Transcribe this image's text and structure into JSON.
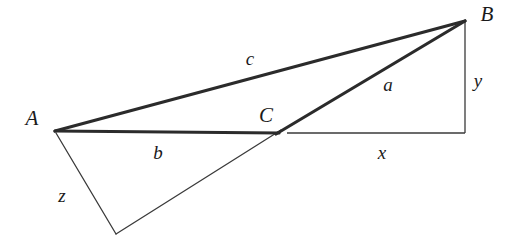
{
  "figure": {
    "type": "geometry-diagram",
    "background_color": "#ffffff",
    "stroke_color": "#2b2b2b",
    "thick_stroke_width": 3,
    "thin_stroke_width": 1,
    "width": 518,
    "height": 245
  },
  "vertices": [
    {
      "id": "A",
      "label": "A",
      "x": 55,
      "y": 131,
      "label_x": 32,
      "label_y": 118
    },
    {
      "id": "B",
      "label": "B",
      "x": 465,
      "y": 21,
      "label_x": 487,
      "label_y": 14
    },
    {
      "id": "C",
      "label": "C",
      "x": 278,
      "y": 133,
      "label_x": 266,
      "label_y": 115
    },
    {
      "id": "D",
      "label": "",
      "x": 116,
      "y": 234,
      "label_x": 116,
      "label_y": 234
    }
  ],
  "side_labels": [
    {
      "id": "c",
      "label": "c",
      "x": 250,
      "y": 58
    },
    {
      "id": "a",
      "label": "a",
      "x": 388,
      "y": 84
    },
    {
      "id": "b",
      "label": "b",
      "x": 158,
      "y": 152
    },
    {
      "id": "z",
      "label": "z",
      "x": 62,
      "y": 195
    },
    {
      "id": "x",
      "label": "x",
      "x": 382,
      "y": 152
    },
    {
      "id": "y",
      "label": "y",
      "x": 478,
      "y": 80
    }
  ],
  "segments": {
    "side_c": {
      "name": "segment-AB",
      "x1": 55,
      "y1": 131,
      "x2": 465,
      "y2": 21,
      "weight": "thick"
    },
    "side_b": {
      "name": "segment-AC",
      "x1": 55,
      "y1": 131,
      "x2": 279,
      "y2": 133,
      "weight": "thick"
    },
    "side_a": {
      "name": "segment-CB",
      "x1": 276,
      "y1": 134,
      "x2": 465,
      "y2": 21,
      "weight": "thick"
    },
    "leg_x": {
      "name": "segment-x",
      "x1": 287,
      "y1": 133,
      "x2": 465,
      "y2": 133,
      "weight": "thin"
    },
    "leg_y": {
      "name": "segment-y",
      "x1": 465,
      "y1": 22,
      "x2": 465,
      "y2": 133,
      "weight": "thin"
    },
    "side_z": {
      "name": "segment-AD",
      "x1": 56,
      "y1": 133,
      "x2": 116,
      "y2": 234,
      "weight": "thin"
    },
    "side_dc": {
      "name": "segment-DC",
      "x1": 116,
      "y1": 234,
      "x2": 281,
      "y2": 130,
      "weight": "thin"
    }
  }
}
